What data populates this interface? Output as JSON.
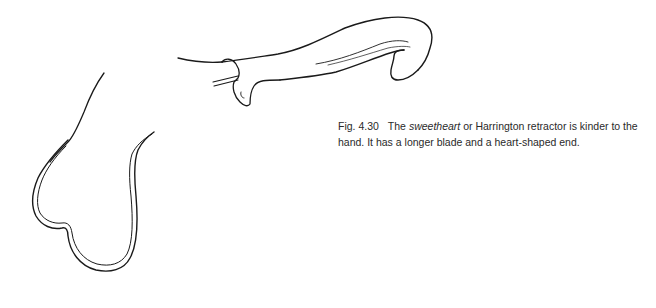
{
  "figure": {
    "illustration": "sweetheart-retractor-drawing",
    "caption": {
      "label": "Fig. 4.30",
      "text_before": "The ",
      "emphasis": "sweetheart",
      "text_after": " or Harrington retractor is kinder to the hand. It has a longer blade and a heart-shaped end."
    }
  },
  "colors": {
    "line": "#1a1a1a",
    "text": "#2a2a2a",
    "background": "#ffffff"
  }
}
